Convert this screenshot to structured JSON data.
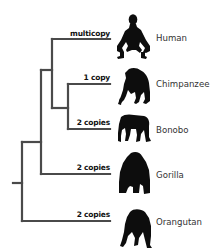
{
  "diagram": {
    "type": "phylogenetic-tree",
    "colors": {
      "branch": "#4a4a4a",
      "silhouette": "#0d0d0d",
      "label": "#333333",
      "copy_label": "#111111",
      "background": "#ffffff"
    },
    "taxa": [
      {
        "name": "Human",
        "copy_label": "multicopy",
        "icon": "human-squatting-silhouette"
      },
      {
        "name": "Chimpanzee",
        "copy_label": "1 copy",
        "icon": "chimpanzee-silhouette"
      },
      {
        "name": "Bonobo",
        "copy_label": "2 copies",
        "icon": "bonobo-silhouette"
      },
      {
        "name": "Gorilla",
        "copy_label": "2 copies",
        "icon": "gorilla-silhouette"
      },
      {
        "name": "Orangutan",
        "copy_label": "2 copies",
        "icon": "orangutan-silhouette"
      }
    ],
    "topology": "(Orangutan,(Gorilla,(Human,(Chimpanzee,Bonobo))))"
  }
}
